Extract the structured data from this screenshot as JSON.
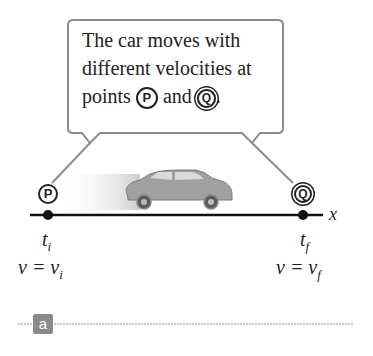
{
  "callout": {
    "line1": "The car moves with",
    "line2": "different velocities at",
    "line3_prefix": "points ",
    "point_p": "P",
    "middle": " and ",
    "point_q": "Q",
    "line3_suffix": "."
  },
  "points": {
    "p": {
      "label": "P",
      "time": "t",
      "time_sub": "i",
      "velocity_lhs": "v = v",
      "velocity_sub": "i"
    },
    "q": {
      "label": "Q",
      "time": "t",
      "time_sub": "f",
      "velocity_lhs": "v = v",
      "velocity_sub": "f"
    }
  },
  "axis": {
    "label": "x"
  },
  "panel": {
    "label": "a"
  },
  "colors": {
    "callout_border": "#8c8c8c",
    "axis_line": "#111111",
    "car_body": "#9a9a9a",
    "badge": "#8a8a8a",
    "divider": "#b5b5b5"
  }
}
